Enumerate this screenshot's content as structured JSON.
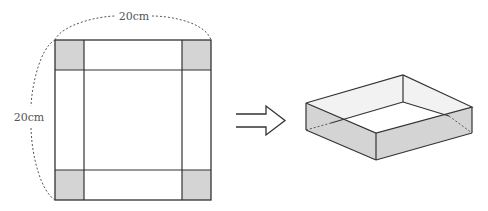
{
  "diagram": {
    "net": {
      "top_dimension_label": "20cm",
      "side_dimension_label": "20cm",
      "corner_squares": [
        "top-left",
        "top-right",
        "bottom-left",
        "bottom-right"
      ]
    },
    "arrow": {
      "direction": "right",
      "style": "double-line"
    },
    "result": {
      "shape": "open-top box"
    },
    "colors": {
      "line": "#333333",
      "shade": "#d4d4d4",
      "dashed": "#555555",
      "background": "#ffffff"
    }
  }
}
